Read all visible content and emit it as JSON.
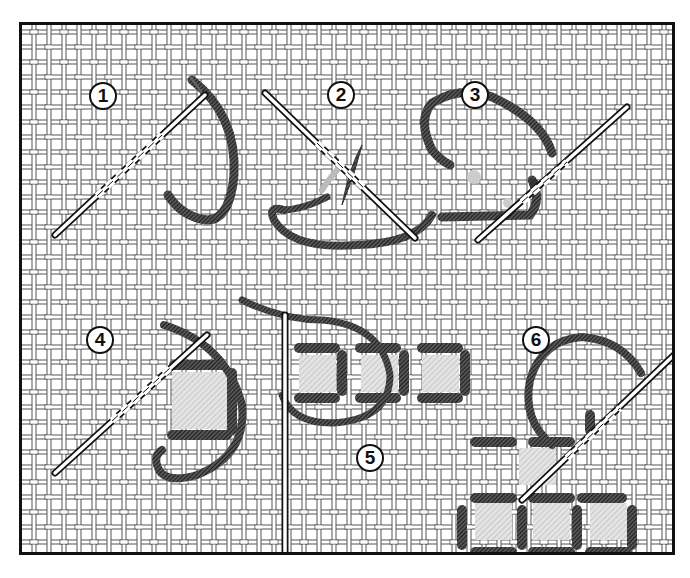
{
  "figure": {
    "steps": [
      {
        "label": "1",
        "x": 103,
        "y": 96
      },
      {
        "label": "2",
        "x": 341,
        "y": 95
      },
      {
        "label": "3",
        "x": 475,
        "y": 95
      },
      {
        "label": "4",
        "x": 100,
        "y": 340
      },
      {
        "label": "5",
        "x": 370,
        "y": 458
      },
      {
        "label": "6",
        "x": 536,
        "y": 340
      }
    ],
    "colors": {
      "thread": "#333333",
      "canvas_line": "#444444",
      "frame": "#111111",
      "background": "#ffffff",
      "shading": "#bbbbbb"
    }
  }
}
